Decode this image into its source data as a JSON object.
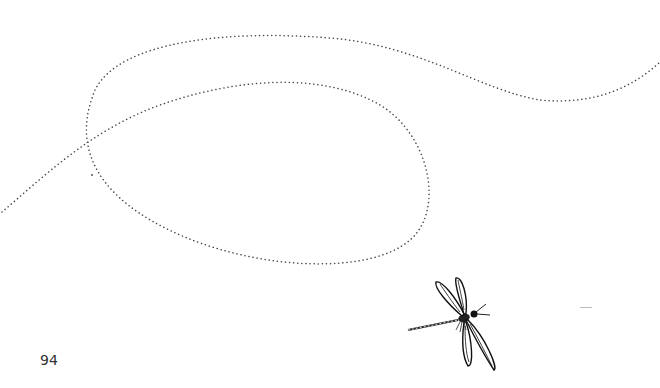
{
  "page": {
    "number": "94",
    "illustration": "dragonfly-icon",
    "decoration": "dotted-flight-path",
    "colors": {
      "background": "#ffffff",
      "line": "#444444",
      "text": "#333333"
    }
  }
}
